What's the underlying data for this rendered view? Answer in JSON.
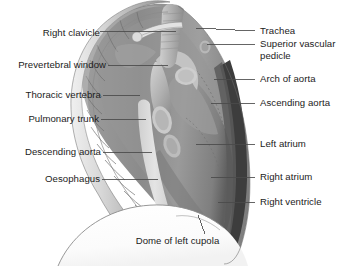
{
  "figure": {
    "background_color": "#ffffff",
    "label_color": "#1b1b1b",
    "leader_line_color": "#4a4a4a",
    "width": 357,
    "height": 267
  },
  "palette": {
    "bone_light": "#e6e6e6",
    "bone_mid": "#c8c8c8",
    "bone_shadow": "#9a9a9a",
    "soft_tissue_light": "#b4b4b4",
    "soft_tissue_mid": "#8e8e8e",
    "soft_tissue_dark": "#6d6d6d",
    "cardiac_border": "#3a3a3a",
    "lucent_band": "#dcdcdc",
    "dome_white": "#fdfdfd",
    "outline": "#555555"
  },
  "labels": {
    "left": [
      {
        "id": "right-clavicle",
        "text": "Right clavicle",
        "x": 30,
        "y": 27,
        "line_x1": 100,
        "line_y1": 31,
        "line_x2": 176,
        "line_y2": 31
      },
      {
        "id": "prevertebral-window",
        "text": "Prevertebral window",
        "x": 4,
        "y": 61,
        "line_x1": 108,
        "line_y1": 65,
        "line_x2": 168,
        "line_y2": 65
      },
      {
        "id": "thoracic-vertebra",
        "text": "Thoracic vertebra",
        "x": 14,
        "y": 91,
        "line_x1": 103,
        "line_y1": 95,
        "line_x2": 140,
        "line_y2": 95
      },
      {
        "id": "pulmonary-trunk",
        "text": "Pulmonary trunk",
        "x": 18,
        "y": 115,
        "line_x1": 101,
        "line_y1": 119,
        "line_x2": 146,
        "line_y2": 119
      },
      {
        "id": "descending-aorta",
        "text": "Descending aorta",
        "x": 13,
        "y": 148,
        "line_x1": 103,
        "line_y1": 152,
        "line_x2": 152,
        "line_y2": 152
      },
      {
        "id": "oesophagus",
        "text": "Oesophagus",
        "x": 37,
        "y": 175,
        "line_x1": 102,
        "line_y1": 179,
        "line_x2": 158,
        "line_y2": 179
      }
    ],
    "right": [
      {
        "id": "trachea",
        "text": "Trachea",
        "x": 274,
        "y": 28,
        "line_x1": 255,
        "line_y1": 32,
        "line_x2": 196,
        "line_y2": 29
      },
      {
        "id": "superior-vascular-pedicle",
        "text": "Superior vascular\npedicle",
        "x": 274,
        "y": 40,
        "line_x1": 255,
        "line_y1": 44,
        "line_x2": 206,
        "line_y2": 44
      },
      {
        "id": "arch-of-aorta",
        "text": "Arch of aorta",
        "x": 274,
        "y": 75,
        "line_x1": 255,
        "line_y1": 79,
        "line_x2": 215,
        "line_y2": 79
      },
      {
        "id": "ascending-aorta",
        "text": "Ascending aorta",
        "x": 274,
        "y": 99,
        "line_x1": 255,
        "line_y1": 103,
        "line_x2": 212,
        "line_y2": 103
      },
      {
        "id": "left-atrium",
        "text": "Left atrium",
        "x": 274,
        "y": 140,
        "line_x1": 255,
        "line_y1": 144,
        "line_x2": 196,
        "line_y2": 144
      },
      {
        "id": "right-atrium",
        "text": "Right atrium",
        "x": 274,
        "y": 173,
        "line_x1": 255,
        "line_y1": 177,
        "line_x2": 211,
        "line_y2": 177
      },
      {
        "id": "right-ventricle",
        "text": "Right ventricle",
        "x": 274,
        "y": 198,
        "line_x1": 255,
        "line_y1": 202,
        "line_x2": 218,
        "line_y2": 202
      }
    ],
    "bottom": [
      {
        "id": "dome-of-left-cupola",
        "text": "Dome of left cupola",
        "x": 117,
        "y": 237,
        "line_x1": 205,
        "line_y1": 236,
        "line_x2": 198,
        "line_y2": 216
      }
    ]
  },
  "structures": [
    {
      "id": "vertebral-column",
      "name": "Thoracic vertebral column"
    },
    {
      "id": "trachea-shadow",
      "name": "Tracheal air column"
    },
    {
      "id": "aortic-arch",
      "name": "Arch of aorta"
    },
    {
      "id": "ascending-aorta",
      "name": "Ascending aorta"
    },
    {
      "id": "cardiac-silhouette",
      "name": "Cardiac silhouette"
    },
    {
      "id": "oesophageal-band",
      "name": "Retrocardiac lucent band"
    },
    {
      "id": "hemidiaphragm-dome",
      "name": "Dome of left hemidiaphragm"
    }
  ]
}
